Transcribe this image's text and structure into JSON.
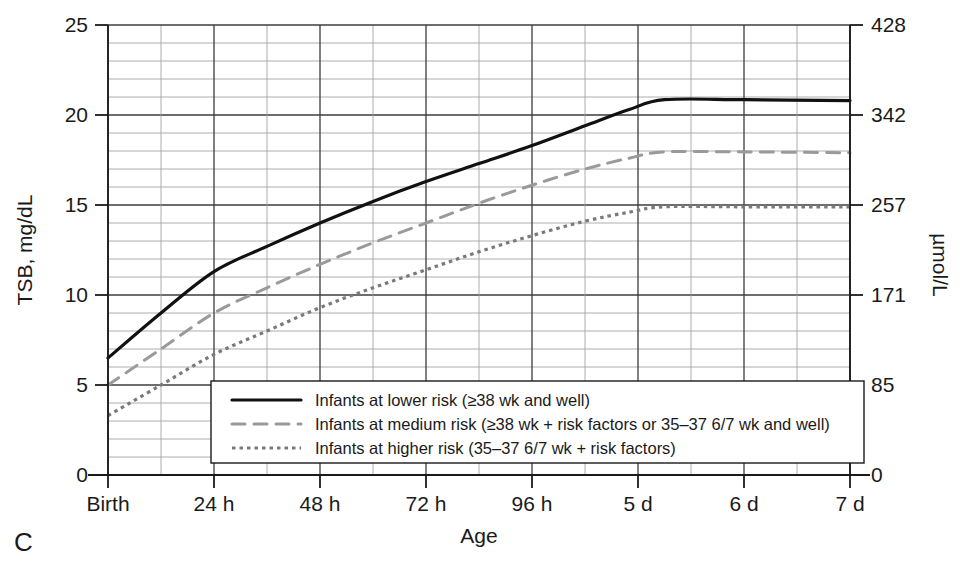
{
  "panel": {
    "letter": "C"
  },
  "chart_data": {
    "type": "line",
    "title": "",
    "xlabel": "Age",
    "ylabel": "TSB, mg/dL",
    "y2label": "µmol/L",
    "categories": [
      "Birth",
      "24 h",
      "48 h",
      "72 h",
      "96 h",
      "5 d",
      "6 d",
      "7 d"
    ],
    "xtick_labels": [
      "Birth",
      "24 h",
      "48 h",
      "72 h",
      "96 h",
      "5 d",
      "6 d",
      "7 d"
    ],
    "xtick_hours": [
      0,
      24,
      48,
      72,
      96,
      120,
      144,
      168
    ],
    "xlim": [
      0,
      168
    ],
    "ylim": [
      0,
      25
    ],
    "ytick_labels": [
      "0",
      "5",
      "10",
      "15",
      "20",
      "25"
    ],
    "ytick_values": [
      0,
      5,
      10,
      15,
      20,
      25
    ],
    "y2tick_labels": [
      "0",
      "85",
      "171",
      "257",
      "342",
      "428"
    ],
    "y2tick_values": [
      0,
      85,
      171,
      257,
      342,
      428
    ],
    "y_minor_step": 1,
    "grid": true,
    "legend_position": "lower center",
    "series": [
      {
        "name": "Infants at lower risk (≥38 wk and well)",
        "style": "solid",
        "color": "#111111",
        "x": [
          0,
          12,
          24,
          36,
          48,
          60,
          72,
          84,
          96,
          108,
          118,
          126,
          144,
          168
        ],
        "values": [
          6.5,
          9.0,
          11.3,
          12.7,
          14.0,
          15.2,
          16.3,
          17.3,
          18.3,
          19.4,
          20.3,
          20.85,
          20.85,
          20.8
        ]
      },
      {
        "name": "Infants at medium risk (≥38 wk + risk factors or 35–37 6/7 wk and well)",
        "style": "dashed",
        "color": "#9a9a9a",
        "x": [
          0,
          12,
          24,
          36,
          48,
          60,
          72,
          84,
          96,
          108,
          118,
          126,
          144,
          168
        ],
        "values": [
          5.0,
          7.0,
          9.0,
          10.4,
          11.7,
          12.9,
          14.0,
          15.1,
          16.1,
          17.0,
          17.6,
          17.95,
          17.95,
          17.9
        ]
      },
      {
        "name": "Infants at higher risk (35–37 6/7 wk + risk factors)",
        "style": "dotted",
        "color": "#7a7a7a",
        "x": [
          0,
          12,
          24,
          36,
          48,
          60,
          72,
          84,
          96,
          108,
          118,
          126,
          144,
          168
        ],
        "values": [
          3.3,
          5.0,
          6.7,
          8.0,
          9.3,
          10.4,
          11.4,
          12.4,
          13.3,
          14.1,
          14.6,
          14.9,
          14.9,
          14.9
        ]
      }
    ],
    "legend_entries": [
      {
        "style": "solid",
        "label": "Infants at lower risk (≥38 wk and well)"
      },
      {
        "style": "dashed",
        "label": "Infants at medium risk (≥38 wk + risk factors or 35–37 6/7 wk and well)"
      },
      {
        "style": "dotted",
        "label": "Infants at higher risk (35–37 6/7 wk + risk factors)"
      }
    ]
  }
}
